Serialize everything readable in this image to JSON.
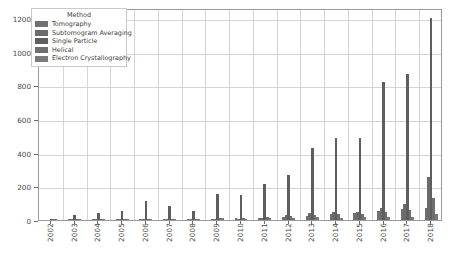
{
  "chart_data": {
    "type": "bar",
    "title": "",
    "xlabel": "",
    "ylabel": "",
    "grid": true,
    "legend_position": "upper-left",
    "legend_title": "Method",
    "ylim": [
      0,
      1260
    ],
    "yticks": [
      0,
      200,
      400,
      600,
      800,
      1000,
      1200
    ],
    "ytick_labels": [
      "0",
      "200",
      "400",
      "600",
      "800",
      "1000",
      "1200"
    ],
    "categories": [
      "2002",
      "2003",
      "2004",
      "2005",
      "2006",
      "2007",
      "2008",
      "2009",
      "2010",
      "2011",
      "2012",
      "2013",
      "2014",
      "2015",
      "2016",
      "2017",
      "2018"
    ],
    "series": [
      {
        "name": "Tomography",
        "color": "#707070",
        "values": [
          0,
          2,
          3,
          4,
          6,
          5,
          5,
          8,
          10,
          14,
          20,
          26,
          33,
          40,
          52,
          68,
          74
        ]
      },
      {
        "name": "Subtomogram Averaging",
        "color": "#6b6b6b",
        "values": [
          0,
          1,
          2,
          3,
          5,
          4,
          4,
          7,
          9,
          12,
          28,
          44,
          46,
          50,
          72,
          96,
          258
        ]
      },
      {
        "name": "Single Particle",
        "color": "#5e5e5e",
        "values": [
          8,
          30,
          42,
          52,
          112,
          84,
          56,
          152,
          148,
          215,
          268,
          428,
          485,
          485,
          820,
          870,
          1200
        ]
      },
      {
        "name": "Helical",
        "color": "#6f6f6f",
        "values": [
          1,
          3,
          4,
          5,
          8,
          7,
          6,
          11,
          12,
          16,
          24,
          30,
          34,
          38,
          48,
          60,
          128
        ]
      },
      {
        "name": "Electron Crystallography",
        "color": "#7a7a7a",
        "values": [
          1,
          4,
          5,
          6,
          9,
          8,
          7,
          10,
          9,
          12,
          14,
          16,
          14,
          15,
          18,
          20,
          34
        ]
      }
    ]
  },
  "legend": {
    "title": "Method",
    "items": [
      {
        "label": "Tomography"
      },
      {
        "label": "Subtomogram Averaging"
      },
      {
        "label": "Single Particle"
      },
      {
        "label": "Helical"
      },
      {
        "label": "Electron Crystallography"
      }
    ]
  }
}
